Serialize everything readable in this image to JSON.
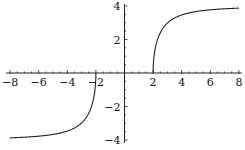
{
  "chart_data": {
    "type": "line",
    "title": "",
    "xlabel": "",
    "ylabel": "",
    "xlim": [
      -8,
      8
    ],
    "ylim": [
      -4,
      4
    ],
    "grid": false,
    "legend": null,
    "x_ticks": [
      -8,
      -6,
      -4,
      -2,
      2,
      4,
      6,
      8
    ],
    "y_ticks": [
      -4,
      -2,
      2,
      4
    ],
    "x_tick_labels": [
      "-8",
      "-6",
      "-4",
      "-2",
      "2",
      "4",
      "6",
      "8"
    ],
    "y_tick_labels": [
      "-4",
      "-2",
      "2",
      "4"
    ],
    "series": [
      {
        "name": "left branch",
        "x": [
          -8,
          -7,
          -6,
          -5,
          -4,
          -3.5,
          -3,
          -2.75,
          -2.5,
          -2.25,
          -2.1,
          -2.02,
          -2
        ],
        "y": [
          -3.87,
          -3.83,
          -3.77,
          -3.67,
          -3.46,
          -3.28,
          -2.98,
          -2.74,
          -2.4,
          -1.83,
          -1.22,
          -0.56,
          0
        ]
      },
      {
        "name": "right branch",
        "x": [
          2,
          2.02,
          2.1,
          2.25,
          2.5,
          2.75,
          3,
          3.5,
          4,
          5,
          6,
          7,
          8
        ],
        "y": [
          0,
          0.56,
          1.22,
          1.83,
          2.4,
          2.74,
          2.98,
          3.28,
          3.46,
          3.67,
          3.77,
          3.83,
          3.87
        ]
      }
    ],
    "color": "#222222"
  }
}
